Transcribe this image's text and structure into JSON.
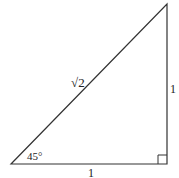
{
  "diagram": {
    "type": "right-triangle",
    "colors": {
      "stroke": "#333333",
      "background": "#ffffff",
      "text": "#222222"
    },
    "vertices": {
      "bottom_left": [
        11,
        164
      ],
      "bottom_right": [
        167,
        164
      ],
      "top_right": [
        167,
        4
      ]
    },
    "labels": {
      "hypotenuse": "√2",
      "vertical_side": "1",
      "horizontal_side": "1",
      "angle": "45°"
    },
    "right_angle_marker": true
  }
}
